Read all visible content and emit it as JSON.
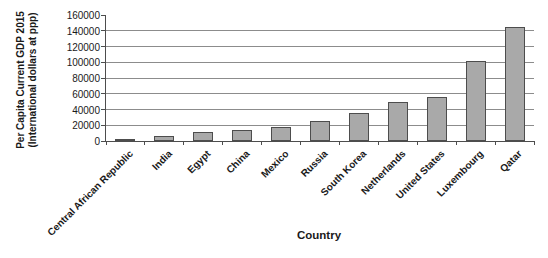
{
  "chart_data": {
    "type": "bar",
    "title": "",
    "categories": [
      "Central African Republic",
      "India",
      "Egypt",
      "China",
      "Mexico",
      "Russia",
      "South Korea",
      "Netherlands",
      "United States",
      "Luxembourg",
      "Qatar"
    ],
    "values": [
      2500,
      6000,
      11500,
      14000,
      17500,
      25000,
      35000,
      49000,
      56500,
      102000,
      145000
    ],
    "xlabel": "Country",
    "ylabel_line1": "Per Capita Current GDP 2015",
    "ylabel_line2": "(International dollars at ppp)",
    "ylim": [
      0,
      160000
    ],
    "ytick_interval": 20000,
    "ytick_labels": [
      "0",
      "20000",
      "40000",
      "60000",
      "80000",
      "100000",
      "120000",
      "140000",
      "160000"
    ],
    "grid": true,
    "legend": "none",
    "colors": {
      "bar_fill": "#a9a9a9",
      "bar_border": "#4d4d4d",
      "gridline": "#8c8c8c",
      "axis": "#4d4d4d",
      "text": "#1a1a1a",
      "background": "#ffffff"
    }
  }
}
